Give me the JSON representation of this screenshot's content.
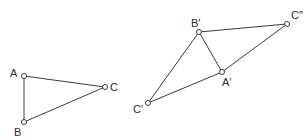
{
  "figure": {
    "left_triangle": {
      "vertices": [
        {
          "id": "A",
          "label": "A",
          "x": 24,
          "y": 76,
          "lx": 10,
          "ly": 68
        },
        {
          "id": "B",
          "label": "B",
          "x": 24,
          "y": 122,
          "lx": 14,
          "ly": 127
        },
        {
          "id": "C",
          "label": "C",
          "x": 105,
          "y": 87,
          "lx": 110,
          "ly": 82
        }
      ],
      "edges": [
        [
          "A",
          "B"
        ],
        [
          "A",
          "C"
        ],
        [
          "B",
          "C"
        ]
      ]
    },
    "right_figure": {
      "vertices": [
        {
          "id": "B1",
          "label": "B′",
          "x": 199,
          "y": 32,
          "lx": 191,
          "ly": 18
        },
        {
          "id": "C2",
          "label": "C″",
          "x": 287,
          "y": 24,
          "lx": 291,
          "ly": 10
        },
        {
          "id": "A1",
          "label": "A′",
          "x": 222,
          "y": 72,
          "lx": 222,
          "ly": 77
        },
        {
          "id": "C1",
          "label": "C′",
          "x": 148,
          "y": 103,
          "lx": 133,
          "ly": 104
        }
      ],
      "edges": [
        [
          "B1",
          "C2"
        ],
        [
          "C2",
          "A1"
        ],
        [
          "A1",
          "C1"
        ],
        [
          "B1",
          "A1"
        ],
        [
          "B1",
          "C1"
        ]
      ]
    },
    "colors": {
      "line": "#3a3a3a",
      "background": "#ffffff",
      "text": "#2a2a2a"
    }
  }
}
